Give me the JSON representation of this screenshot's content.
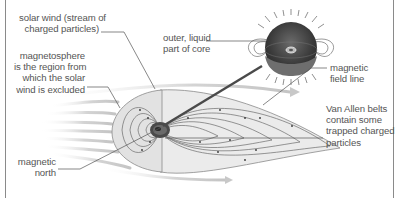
{
  "diagram": {
    "type": "labeled scientific illustration",
    "colors": {
      "text": "#555555",
      "leader_line": "#555555",
      "border": "#8a8a8a",
      "field_fill": "#e6e6e6",
      "field_line": "#6b6b6b",
      "solar_wind": "#c8c8c8",
      "core_dark": "#3a3a3a"
    },
    "labels": {
      "solar_wind": "solar wind (stream of\ncharged particles)",
      "magnetosphere": "magnetosphere\nis the region from\nwhich the solar\nwind is excluded",
      "magnetic_north": "magnetic\nnorth",
      "outer_core": "outer, liquid\npart of core",
      "field_line": "magnetic\nfield line",
      "van_allen": "Van Allen belts\ncontain some\ntrapped charged\nparticles"
    }
  }
}
